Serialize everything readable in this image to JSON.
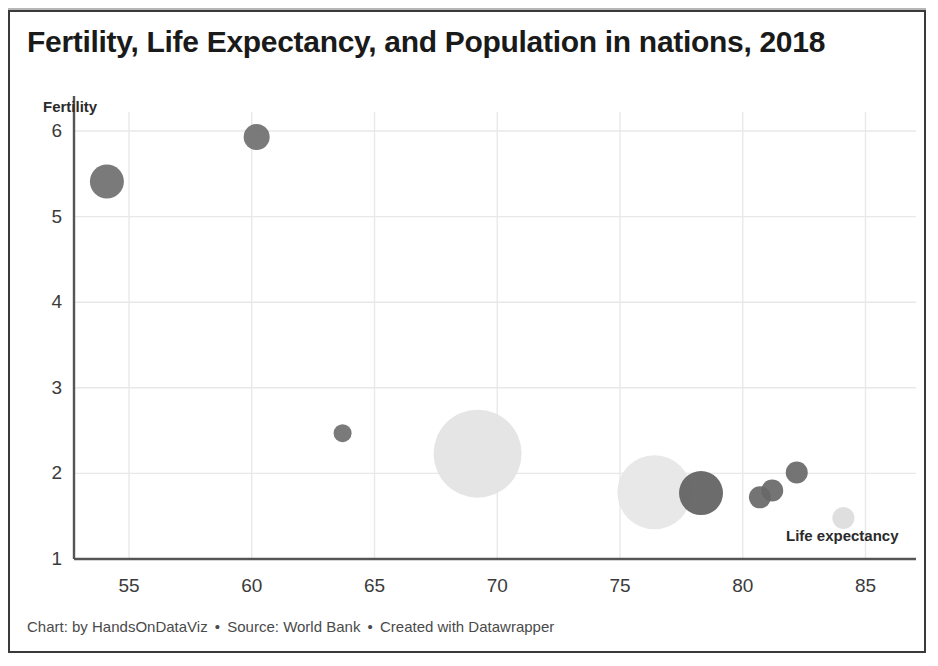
{
  "chart_data": {
    "type": "scatter",
    "title": "Fertility, Life Expectancy, and Population in nations, 2018",
    "xlabel": "Life expectancy",
    "ylabel": "Fertility",
    "xlim": [
      52.2,
      88.0
    ],
    "ylim": [
      1,
      6
    ],
    "xticks": [
      55,
      60,
      65,
      70,
      75,
      80,
      85
    ],
    "yticks": [
      1,
      2,
      3,
      4,
      5,
      6
    ],
    "grid": true,
    "legend": "none",
    "bubble_size_encodes": "Population",
    "points": [
      {
        "x": 54.1,
        "y": 5.41,
        "r": 17,
        "color": "#6f6f6f"
      },
      {
        "x": 60.2,
        "y": 5.93,
        "r": 13,
        "color": "#6f6f6f"
      },
      {
        "x": 63.7,
        "y": 2.47,
        "r": 9,
        "color": "#6f6f6f"
      },
      {
        "x": 69.2,
        "y": 2.23,
        "r": 44,
        "color": "#e3e3e3"
      },
      {
        "x": 76.4,
        "y": 1.78,
        "r": 37,
        "color": "#e6e6e6"
      },
      {
        "x": 78.3,
        "y": 1.77,
        "r": 22,
        "color": "#5f5f5f"
      },
      {
        "x": 80.7,
        "y": 1.72,
        "r": 11,
        "color": "#686868"
      },
      {
        "x": 81.2,
        "y": 1.8,
        "r": 11,
        "color": "#686868"
      },
      {
        "x": 82.2,
        "y": 2.01,
        "r": 11,
        "color": "#686868"
      },
      {
        "x": 84.1,
        "y": 1.48,
        "r": 11,
        "color": "#dcdcdc"
      }
    ]
  },
  "footer": {
    "chart_credit": "Chart: by HandsOnDataViz",
    "source_credit": "Source: World Bank",
    "tool_credit": "Created with Datawrapper",
    "separator": "•"
  },
  "colors": {
    "axis": "#555555",
    "grid": "#e8e8e8",
    "text": "#1a1a1a",
    "bubble_dark": "#6f6f6f",
    "bubble_light": "#e3e3e3"
  }
}
